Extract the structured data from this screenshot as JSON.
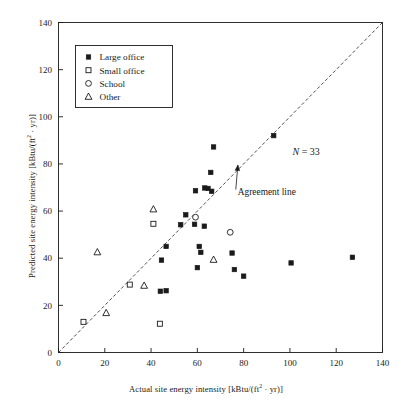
{
  "chart_data": {
    "type": "scatter",
    "title": "",
    "xlabel": "Actual site energy intensity [kBtu/(ft² · yr)]",
    "ylabel": "Predicted site energy intensity [kBtu/(ft² · yr)]",
    "xlim": [
      0,
      140
    ],
    "ylim": [
      0,
      140
    ],
    "xticks": [
      0,
      20,
      40,
      60,
      80,
      100,
      120,
      140
    ],
    "yticks": [
      0,
      20,
      40,
      60,
      80,
      100,
      120,
      140
    ],
    "grid": false,
    "legend_position": "top-left",
    "annotations": [
      {
        "name": "sample-count",
        "text": "N = 33",
        "x": 107,
        "y": 84
      },
      {
        "name": "agreement-line-label",
        "text": "Agreement line",
        "x": 90,
        "y": 67
      }
    ],
    "reference_line": {
      "name": "agreement-line",
      "label": "Agreement line",
      "style": "dashed",
      "from": [
        0,
        0
      ],
      "to": [
        140,
        140
      ]
    },
    "series": [
      {
        "name": "Large office",
        "marker": "filled-square",
        "color": "#1a1a1a",
        "points": [
          [
            44.0,
            26.0
          ],
          [
            46.5,
            26.2
          ],
          [
            44.5,
            39.2
          ],
          [
            46.5,
            45.0
          ],
          [
            52.8,
            54.2
          ],
          [
            55.0,
            58.4
          ],
          [
            58.8,
            54.4
          ],
          [
            63.0,
            53.6
          ],
          [
            60.8,
            45.0
          ],
          [
            61.5,
            42.5
          ],
          [
            60.0,
            36.0
          ],
          [
            59.2,
            68.6
          ],
          [
            63.2,
            69.8
          ],
          [
            64.6,
            69.6
          ],
          [
            66.2,
            68.4
          ],
          [
            65.8,
            76.4
          ],
          [
            67.0,
            87.2
          ],
          [
            75.0,
            42.2
          ],
          [
            76.0,
            35.2
          ],
          [
            80.0,
            32.4
          ],
          [
            93.0,
            92.0
          ],
          [
            100.5,
            38.0
          ],
          [
            127.0,
            40.4
          ]
        ]
      },
      {
        "name": "Small office",
        "marker": "open-square",
        "color": "#1a1a1a",
        "points": [
          [
            10.8,
            13.0
          ],
          [
            30.8,
            28.8
          ],
          [
            41.0,
            54.6
          ],
          [
            43.8,
            12.2
          ]
        ]
      },
      {
        "name": "School",
        "marker": "open-circle",
        "color": "#1a1a1a",
        "points": [
          [
            59.2,
            57.4
          ],
          [
            74.2,
            51.0
          ]
        ]
      },
      {
        "name": "Other",
        "marker": "open-triangle",
        "color": "#1a1a1a",
        "points": [
          [
            16.8,
            42.6
          ],
          [
            20.6,
            16.8
          ],
          [
            37.0,
            28.4
          ],
          [
            41.0,
            60.8
          ],
          [
            67.0,
            39.4
          ]
        ]
      }
    ]
  },
  "legend": {
    "entries": [
      {
        "label": "Large office",
        "marker": "filled-square"
      },
      {
        "label": "Small office",
        "marker": "open-square"
      },
      {
        "label": "School",
        "marker": "open-circle"
      },
      {
        "label": "Other",
        "marker": "open-triangle"
      }
    ]
  },
  "axes": {
    "x_title_main": "Actual site energy intensity [kBtu/(ft",
    "x_title_sup": "2",
    "x_title_tail": " · yr)]",
    "y_title_main": "Predicted site energy intensity [kBtu/(ft",
    "y_title_sup": "2",
    "y_title_tail": " · yr)]"
  }
}
